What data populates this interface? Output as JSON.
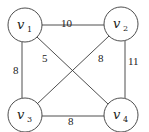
{
  "graph": {
    "nodes": [
      {
        "id": "v1",
        "base": "v",
        "sub": "1",
        "cx": 25,
        "cy": 25
      },
      {
        "id": "v2",
        "base": "v",
        "sub": "2",
        "cx": 121,
        "cy": 24
      },
      {
        "id": "v3",
        "base": "v",
        "sub": "3",
        "cx": 25,
        "cy": 115
      },
      {
        "id": "v4",
        "base": "v",
        "sub": "4",
        "cx": 121,
        "cy": 115
      }
    ],
    "edges": [
      {
        "from": "v1",
        "to": "v2",
        "weight": "10"
      },
      {
        "from": "v1",
        "to": "v3",
        "weight": "8"
      },
      {
        "from": "v1",
        "to": "v4",
        "weight": "5"
      },
      {
        "from": "v2",
        "to": "v3",
        "weight": "8"
      },
      {
        "from": "v2",
        "to": "v4",
        "weight": "11"
      },
      {
        "from": "v3",
        "to": "v4",
        "weight": "8"
      }
    ],
    "node_radius": 17,
    "stroke_color": "#3a3a3a"
  }
}
